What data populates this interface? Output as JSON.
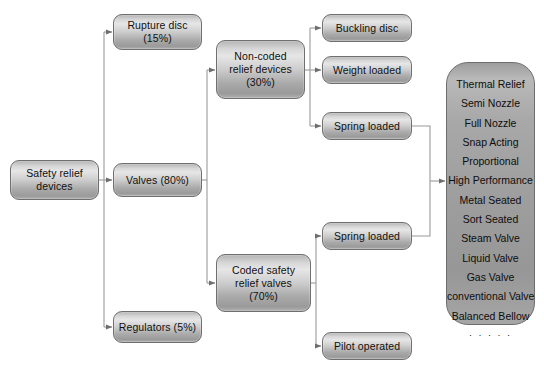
{
  "diagram": {
    "type": "flowchart",
    "nodes": [
      {
        "id": "root",
        "label": [
          "Safety relief",
          "devices"
        ]
      },
      {
        "id": "rupture",
        "label": [
          "Rupture disc",
          "(15%)"
        ]
      },
      {
        "id": "valves",
        "label": [
          "Valves (80%)"
        ]
      },
      {
        "id": "regulators",
        "label": [
          "Regulators (5%)"
        ]
      },
      {
        "id": "noncoded",
        "label": [
          "Non-coded",
          "relief devices",
          "(30%)"
        ]
      },
      {
        "id": "coded",
        "label": [
          "Coded safety",
          "relief valves",
          "(70%)"
        ]
      },
      {
        "id": "buckling",
        "label": [
          "Buckling disc"
        ]
      },
      {
        "id": "weight",
        "label": [
          "Weight loaded"
        ]
      },
      {
        "id": "spring_top",
        "label": [
          "Spring loaded"
        ]
      },
      {
        "id": "spring_bot",
        "label": [
          "Spring loaded"
        ]
      },
      {
        "id": "pilot",
        "label": [
          "Pilot operated"
        ]
      }
    ],
    "types_panel": {
      "items": [
        "Thermal Relief",
        "Semi Nozzle",
        "Full Nozzle",
        "Snap Acting",
        "Proportional",
        "High Performance",
        "Metal Seated",
        "Sort Seated",
        "Steam Valve",
        "Liquid Valve",
        "Gas Valve",
        "conventional Valve",
        "Balanced Bellow"
      ],
      "continuation": "· · · · ·"
    },
    "colors": {
      "node_fill_light": "#e6e6e6",
      "node_fill_dark": "#9a9a9a",
      "node_border": "#6f6f6f",
      "panel_fill": "#a0a0a0",
      "connector": "#8a8a8a",
      "background": "#ffffff",
      "text": "#101010"
    }
  }
}
